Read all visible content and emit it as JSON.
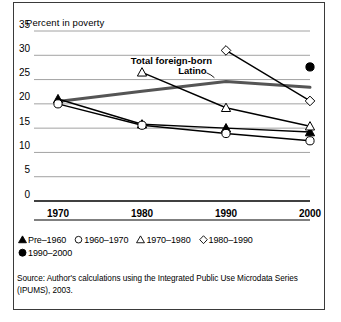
{
  "figure": {
    "title": "Percent in poverty",
    "source_note": "Source: Author's calculations using the Integrated Public Use Microdata Series (IPUMS), 2003."
  },
  "legend": {
    "rows": [
      [
        {
          "symbol": "filled-triangle",
          "label": "Pre–1960"
        },
        {
          "symbol": "open-circle",
          "label": "1960–1970"
        },
        {
          "symbol": "open-triangle",
          "label": "1970–1980"
        },
        {
          "symbol": "open-diamond",
          "label": "1980–1990"
        }
      ],
      [
        {
          "symbol": "filled-circle",
          "label": "1990–2000"
        }
      ]
    ]
  },
  "chart_data": {
    "type": "line",
    "title": "Percent in poverty",
    "xlabel": "",
    "ylabel": "Percent in poverty",
    "x": [
      1970,
      1980,
      1990,
      2000
    ],
    "xticklabels": [
      "1970",
      "1980",
      "1990",
      "2000"
    ],
    "ylim": [
      0,
      35
    ],
    "yticks": [
      0,
      5,
      10,
      15,
      20,
      25,
      30,
      35
    ],
    "yticklabels": [
      "0",
      "5",
      "10",
      "15",
      "20",
      "25",
      "30",
      "35"
    ],
    "grid": true,
    "legend_position": "below-axis",
    "series": [
      {
        "name": "Pre–1960",
        "marker": "filled-triangle",
        "color": "#000000",
        "x": [
          1970,
          1980,
          1990,
          2000
        ],
        "values": [
          21.0,
          15.8,
          15.0,
          14.2
        ]
      },
      {
        "name": "1960–1970",
        "marker": "open-circle",
        "color": "#000000",
        "x": [
          1970,
          1980,
          1990,
          2000
        ],
        "values": [
          20.0,
          15.6,
          13.9,
          12.4
        ]
      },
      {
        "name": "1970–1980",
        "marker": "open-triangle",
        "color": "#000000",
        "x": [
          1980,
          1990,
          2000
        ],
        "values": [
          26.5,
          19.2,
          15.4
        ]
      },
      {
        "name": "1980–1990",
        "marker": "open-diamond",
        "color": "#000000",
        "x": [
          1990,
          2000
        ],
        "values": [
          31.0,
          20.6
        ]
      },
      {
        "name": "1990–2000",
        "marker": "filled-circle",
        "color": "#000000",
        "x": [
          2000
        ],
        "values": [
          27.6
        ]
      },
      {
        "name": "Latino",
        "marker": "none",
        "color": "#555555",
        "line_width": 3,
        "x": [
          1970,
          1980,
          1990,
          2000
        ],
        "values": [
          20.5,
          22.6,
          24.6,
          23.4
        ]
      }
    ],
    "annotations": [
      {
        "text": "Total foreign-born",
        "x": 1983.5,
        "y": 28.2
      },
      {
        "text": "Latino",
        "x": 1986.0,
        "y": 26.2
      }
    ]
  }
}
